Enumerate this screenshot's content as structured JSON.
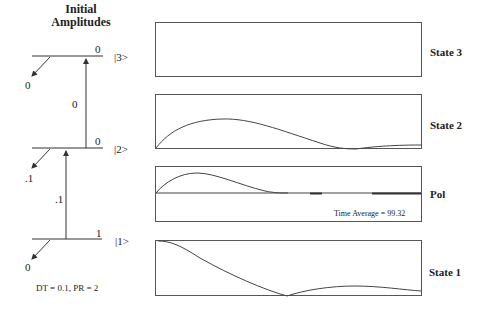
{
  "diagram": {
    "title_line1": "Initial",
    "title_line2": "Amplitudes",
    "levels": [
      {
        "ket": "|3>",
        "amplitude": "0",
        "decay_amplitude": "0"
      },
      {
        "ket": "|2>",
        "amplitude": "0",
        "decay_amplitude": ".1"
      },
      {
        "ket": "|1>",
        "amplitude": "1",
        "decay_amplitude": "0"
      }
    ],
    "transitions": [
      {
        "from": "|2>",
        "to": "|3>",
        "label": "0"
      },
      {
        "from": "|1>",
        "to": "|2>",
        "label": ".1"
      }
    ],
    "parameters": "DT = 0.1, PR = 2"
  },
  "plots": {
    "state3": {
      "label": "State 3"
    },
    "state2": {
      "label": "State 2"
    },
    "pol": {
      "label": "Pol",
      "time_average": "Time Average = 99.32"
    },
    "state1": {
      "label": "State 1"
    }
  },
  "colors": {
    "line": "#444444",
    "border": "#555555",
    "background": "#ffffff"
  }
}
